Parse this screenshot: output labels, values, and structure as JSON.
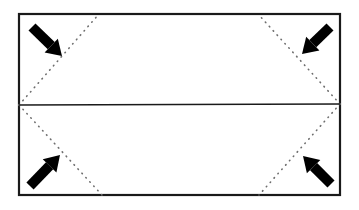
{
  "diagram": {
    "title": "Origami fold diagram",
    "type": "origami-fold-step",
    "colors": {
      "paper": "#ffffff",
      "outline": "#1a1a1a",
      "crease_solid": "#1a1a1a",
      "crease_dotted": "#6e6e6e",
      "arrow": "#000000"
    },
    "paper": {
      "label": "paper-rectangle",
      "x": 19,
      "y": 14,
      "width": 321,
      "height": 181,
      "stroke_width": 2.2
    },
    "creases": [
      {
        "name": "center-horizontal-crease",
        "style": "solid",
        "x1": 19,
        "y1": 105,
        "x2": 340,
        "y2": 104
      },
      {
        "name": "diagonal-crease-top-left",
        "style": "dotted",
        "x1": 19,
        "y1": 105,
        "x2": 99,
        "y2": 14
      },
      {
        "name": "diagonal-crease-top-right",
        "style": "dotted",
        "x1": 340,
        "y1": 104,
        "x2": 258,
        "y2": 14
      },
      {
        "name": "diagonal-crease-bottom-left",
        "style": "dotted",
        "x1": 19,
        "y1": 105,
        "x2": 102,
        "y2": 195
      },
      {
        "name": "diagonal-crease-bottom-right",
        "style": "dotted",
        "x1": 340,
        "y1": 104,
        "x2": 259,
        "y2": 195
      }
    ],
    "arrows": [
      {
        "name": "fold-arrow-top-left",
        "direction": "down-right",
        "direction_degrees": 45,
        "tail_x": 32,
        "tail_y": 27,
        "tip_x": 62,
        "tip_y": 56
      },
      {
        "name": "fold-arrow-top-right",
        "direction": "down-left",
        "direction_degrees": 135,
        "tail_x": 330,
        "tail_y": 27,
        "tip_x": 302,
        "tip_y": 54
      },
      {
        "name": "fold-arrow-bottom-left",
        "direction": "up-right",
        "direction_degrees": 315,
        "tail_x": 30,
        "tail_y": 186,
        "tip_x": 60,
        "tip_y": 155
      },
      {
        "name": "fold-arrow-bottom-right",
        "direction": "up-left",
        "direction_degrees": 225,
        "tail_x": 331,
        "tail_y": 184,
        "tip_x": 303,
        "tip_y": 156
      }
    ]
  }
}
